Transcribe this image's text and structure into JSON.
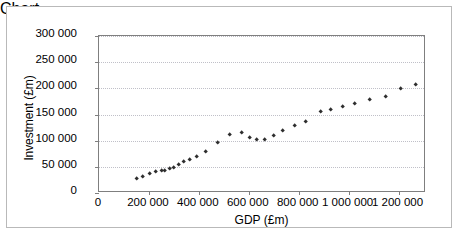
{
  "chart": {
    "type": "scatter",
    "title": "",
    "xlabel": "GDP (£m)",
    "ylabel": "Investment (£m)",
    "marker": "diamond",
    "marker_color": "#2e2e2e",
    "grid": "horizontal",
    "legend": "none",
    "x_tick_labels": [
      "0",
      "200 000",
      "400 000",
      "600 000",
      "800 000",
      "1 000 000",
      "1 200 000"
    ],
    "y_tick_labels": [
      "0",
      "50 000",
      "100 000",
      "150 000",
      "200 000",
      "250 000",
      "300 000"
    ]
  },
  "chart_data": {
    "type": "scatter",
    "title": "",
    "xlabel": "GDP (£m)",
    "ylabel": "Investment (£m)",
    "xlim": [
      0,
      1310000
    ],
    "ylim": [
      0,
      300000
    ],
    "xticks": [
      0,
      200000,
      400000,
      600000,
      800000,
      1000000,
      1200000
    ],
    "yticks": [
      0,
      50000,
      100000,
      150000,
      200000,
      250000,
      300000
    ],
    "xtick_labels": [
      "0",
      "200 000",
      "400 000",
      "600 000",
      "800 000",
      "1 000 000",
      "1 200 000"
    ],
    "ytick_labels": [
      "0",
      "50 000",
      "100 000",
      "150 000",
      "200 000",
      "250 000",
      "300 000"
    ],
    "grid": true,
    "grid_axis": "y",
    "legend": false,
    "marker": "diamond",
    "series": [
      {
        "name": "GDP vs Investment",
        "points": [
          [
            152000,
            27000
          ],
          [
            176000,
            31000
          ],
          [
            203000,
            37000
          ],
          [
            228000,
            41000
          ],
          [
            250000,
            42000
          ],
          [
            264000,
            43000
          ],
          [
            284000,
            46000
          ],
          [
            300000,
            49000
          ],
          [
            318000,
            54000
          ],
          [
            340000,
            59000
          ],
          [
            362000,
            63000
          ],
          [
            390000,
            69000
          ],
          [
            428000,
            79000
          ],
          [
            477000,
            97000
          ],
          [
            524000,
            112000
          ],
          [
            572000,
            116000
          ],
          [
            604000,
            106000
          ],
          [
            630000,
            102000
          ],
          [
            664000,
            102000
          ],
          [
            700000,
            110000
          ],
          [
            734000,
            120000
          ],
          [
            782000,
            129000
          ],
          [
            830000,
            137000
          ],
          [
            888000,
            155000
          ],
          [
            928000,
            160000
          ],
          [
            976000,
            165000
          ],
          [
            1024000,
            170000
          ],
          [
            1086000,
            178000
          ],
          [
            1148000,
            184000
          ],
          [
            1208000,
            199000
          ],
          [
            1268000,
            207000
          ]
        ]
      }
    ]
  }
}
